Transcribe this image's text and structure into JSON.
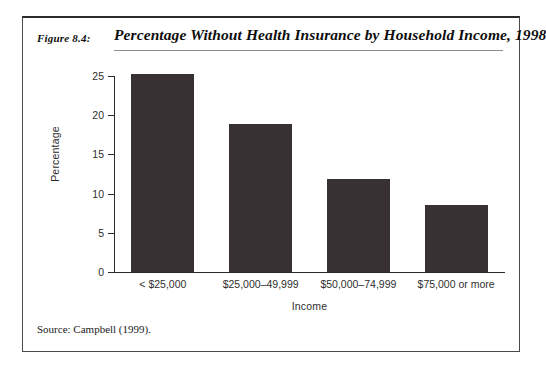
{
  "figure": {
    "number": "Figure 8.4:",
    "title": "Percentage Without Health Insurance by Household Income, 1998",
    "source": "Source: Campbell (1999)."
  },
  "chart_data": {
    "type": "bar",
    "title": "Percentage Without Health Insurance by Household Income, 1998",
    "xlabel": "Income",
    "ylabel": "Percentage",
    "categories": [
      "< $25,000",
      "$25,000–49,999",
      "$50,000–74,999",
      "$75,000 or more"
    ],
    "values": [
      25.3,
      18.9,
      11.9,
      8.6
    ],
    "ylim": [
      0,
      25
    ],
    "yticks": [
      0,
      5,
      10,
      15,
      20,
      25
    ],
    "ytick_labels": [
      "0",
      "5",
      "10",
      "15",
      "20",
      "25"
    ],
    "grid": false,
    "legend": false,
    "bar_color": "#373133"
  }
}
